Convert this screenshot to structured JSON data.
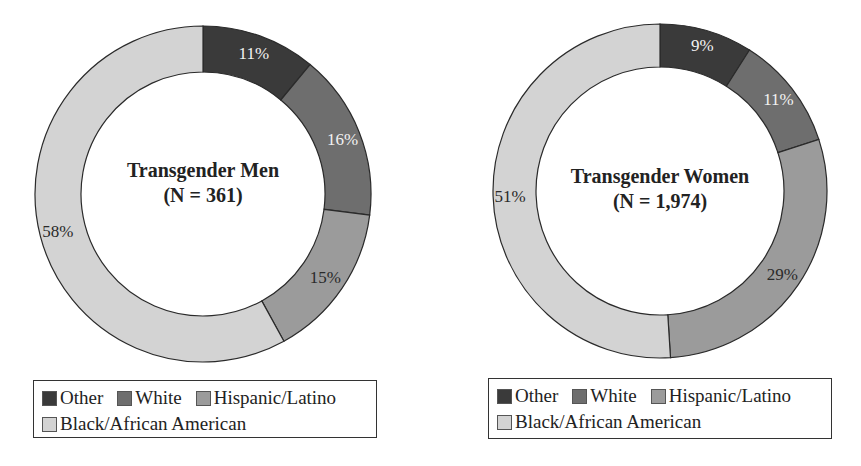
{
  "chart_data": [
    {
      "type": "pie",
      "variant": "donut",
      "title": "Transgender Men",
      "subtitle": "(N = 361)",
      "categories": [
        "Other",
        "White",
        "Hispanic/Latino",
        "Black/African American"
      ],
      "values": [
        11,
        16,
        15,
        58
      ],
      "labels": [
        "11%",
        "16%",
        "15%",
        "58%"
      ],
      "colors": [
        "#3a3a3a",
        "#6e6e6e",
        "#9b9b9b",
        "#d3d3d3"
      ],
      "start_angle": "12 o'clock, clockwise",
      "legend_position": "bottom"
    },
    {
      "type": "pie",
      "variant": "donut",
      "title": "Transgender Women",
      "subtitle": "(N = 1,974)",
      "categories": [
        "Other",
        "White",
        "Hispanic/Latino",
        "Black/African American"
      ],
      "values": [
        9,
        11,
        29,
        51
      ],
      "labels": [
        "9%",
        "11%",
        "29%",
        "51%"
      ],
      "colors": [
        "#3a3a3a",
        "#6e6e6e",
        "#9b9b9b",
        "#d3d3d3"
      ],
      "start_angle": "12 o'clock, clockwise",
      "legend_position": "bottom"
    }
  ],
  "charts": [
    {
      "title": "Transgender Men",
      "subtitle": "(N = 361)",
      "legend": {
        "items": [
          {
            "label": "Other",
            "color": "#3a3a3a"
          },
          {
            "label": "White",
            "color": "#6e6e6e"
          },
          {
            "label": "Hispanic/Latino",
            "color": "#9b9b9b"
          },
          {
            "label": "Black/African American",
            "color": "#d3d3d3"
          }
        ]
      }
    },
    {
      "title": "Transgender Women",
      "subtitle": "(N = 1,974)",
      "legend": {
        "items": [
          {
            "label": "Other",
            "color": "#3a3a3a"
          },
          {
            "label": "White",
            "color": "#6e6e6e"
          },
          {
            "label": "Hispanic/Latino",
            "color": "#9b9b9b"
          },
          {
            "label": "Black/African American",
            "color": "#d3d3d3"
          }
        ]
      }
    }
  ],
  "style": {
    "outline_color": "#2a2a2a",
    "light_label_color": "#f2f2f2",
    "dark_label_color": "#2a2a2a"
  }
}
